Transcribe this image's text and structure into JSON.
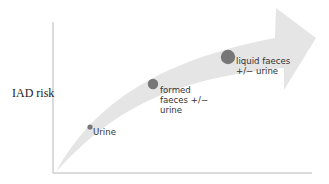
{
  "y_axis": {
    "label": "IAD risk"
  },
  "x_axis": {
    "label": ""
  },
  "arrow": {
    "color": "#e6e6e6"
  },
  "points": [
    {
      "label": "Urine",
      "size": "small",
      "color": "#777777"
    },
    {
      "label": "formed\nfaeces +/−\nurine",
      "size": "medium",
      "color": "#777777"
    },
    {
      "label": "liquid faeces\n+/− urine",
      "size": "large",
      "color": "#777777"
    }
  ]
}
